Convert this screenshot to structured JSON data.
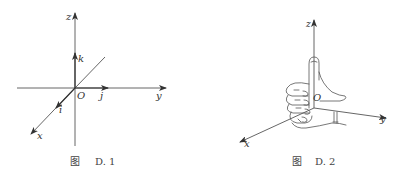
{
  "figures": [
    {
      "id": "D.1",
      "caption_prefix": "图",
      "caption_number": "D. 1",
      "labels": {
        "z": "z",
        "y": "y",
        "x": "x",
        "origin": "O",
        "i": "i",
        "j": "j",
        "k": "k"
      },
      "description": "Right-handed Cartesian coordinate system with unit vectors i, j, k"
    },
    {
      "id": "D.2",
      "caption_prefix": "图",
      "caption_number": "D. 2",
      "labels": {
        "z": "z",
        "y": "y",
        "x": "x",
        "origin": "O"
      },
      "description": "Right-hand rule: fingers curl from x toward y, thumb points along z"
    }
  ],
  "colors": {
    "line": "#555555",
    "text": "#333333",
    "background": "#ffffff"
  }
}
